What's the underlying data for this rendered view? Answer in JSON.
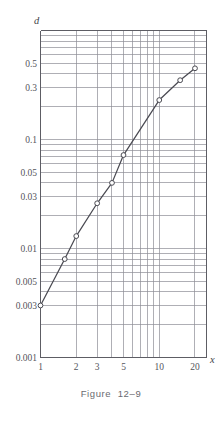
{
  "figure": {
    "caption": "Figure  12–9",
    "y_axis_name": "d",
    "x_axis_name": "x"
  },
  "chart_data": {
    "type": "line",
    "title": "",
    "subtitle": "",
    "xlabel": "x",
    "ylabel": "d",
    "xscale": "log",
    "yscale": "log",
    "xlim": [
      1,
      25
    ],
    "ylim": [
      0.001,
      1.0
    ],
    "grid": true,
    "legend": null,
    "x_ticks": [
      1,
      2,
      3,
      5,
      10,
      20
    ],
    "x_tick_labels": [
      "1",
      "2",
      "3",
      "5",
      "10",
      "20"
    ],
    "x_gridlines": [
      1,
      2,
      3,
      4,
      5,
      6,
      7,
      8,
      9,
      10,
      20
    ],
    "y_ticks": [
      0.003,
      0.005,
      0.01,
      0.03,
      0.05,
      0.1,
      0.3,
      0.5,
      0.001
    ],
    "y_tick_labels": [
      "0.003",
      "0.005",
      "0.01",
      "0.03",
      "0.05",
      "0.1",
      "0.3",
      "0.5",
      "0.001"
    ],
    "y_gridlines": [
      0.001,
      0.002,
      0.003,
      0.004,
      0.005,
      0.006,
      0.007,
      0.008,
      0.009,
      0.01,
      0.02,
      0.03,
      0.04,
      0.05,
      0.06,
      0.07,
      0.08,
      0.09,
      0.1,
      0.2,
      0.3,
      0.4,
      0.5,
      0.6,
      0.7,
      0.8,
      0.9
    ],
    "series": [
      {
        "name": "d",
        "marker": "open-circle",
        "x": [
          1,
          1.6,
          2,
          3,
          4,
          5,
          10,
          15,
          20
        ],
        "values": [
          0.003,
          0.008,
          0.013,
          0.026,
          0.04,
          0.072,
          0.23,
          0.35,
          0.45
        ]
      }
    ],
    "line_color": "#4a4a52",
    "grid_color": "#8d8d95",
    "marker_fill": "#ffffff"
  }
}
